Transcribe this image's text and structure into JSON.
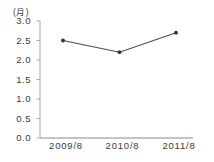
{
  "chart_data": {
    "type": "line",
    "unit_label": "(月)",
    "categories": [
      "2009/8",
      "2010/8",
      "2011/8"
    ],
    "series": [
      {
        "name": "months",
        "values": [
          2.5,
          2.2,
          2.7
        ]
      }
    ],
    "ylim": [
      0.0,
      3.0
    ],
    "ytick_step": 0.5,
    "ytick_labels": [
      "0.0",
      "0.5",
      "1.0",
      "1.5",
      "2.0",
      "2.5",
      "3.0"
    ],
    "grid": false,
    "legend": "none",
    "colors": {
      "line": "#4a4a4a",
      "marker": "#333333",
      "y_axis": "#aaaaaa",
      "x_axis": "#8a8a8a",
      "tick": "#aaaaaa",
      "text": "#3a3a3a",
      "background": "#ffffff"
    }
  }
}
